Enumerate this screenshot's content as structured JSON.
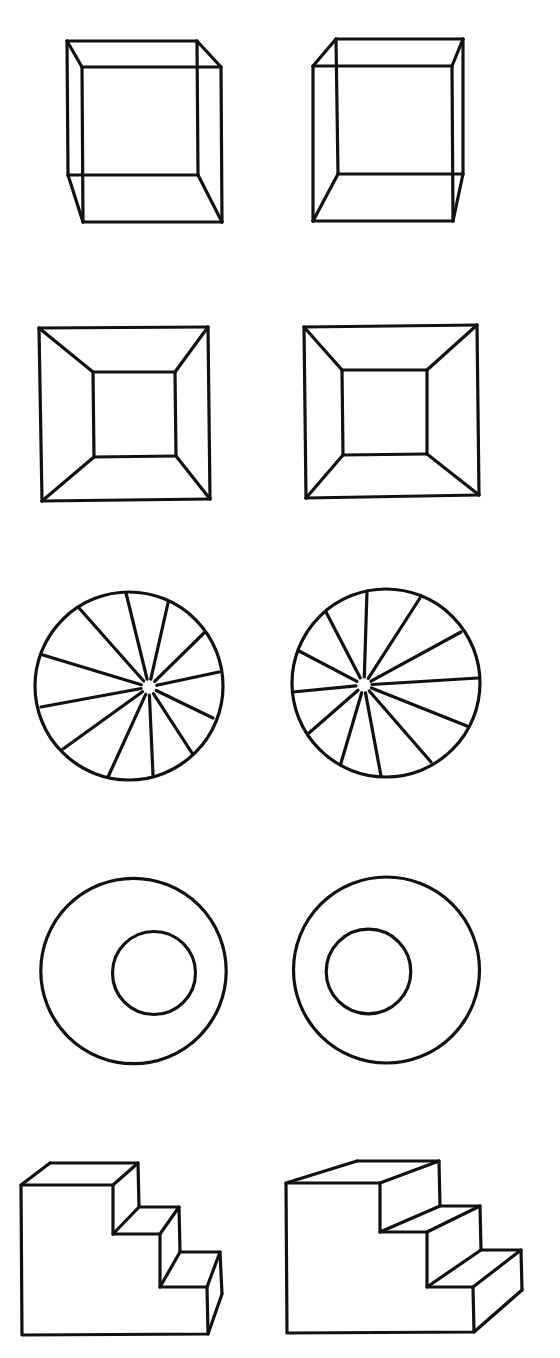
{
  "colors": {
    "background": "#ffffff",
    "stroke": "#111111"
  },
  "stroke_width": 3.2,
  "pairs": [
    {
      "name": "wire-cube-pair",
      "left": {
        "lines": [
          [
            67,
            41,
            197,
            41
          ],
          [
            197,
            41,
            198,
            175
          ],
          [
            198,
            175,
            68,
            175
          ],
          [
            68,
            175,
            67,
            41
          ],
          [
            82,
            67,
            221,
            67
          ],
          [
            221,
            67,
            222,
            222
          ],
          [
            222,
            222,
            83,
            222
          ],
          [
            83,
            222,
            82,
            67
          ],
          [
            67,
            41,
            82,
            67
          ],
          [
            197,
            41,
            221,
            67
          ],
          [
            198,
            175,
            222,
            222
          ],
          [
            68,
            175,
            83,
            222
          ]
        ]
      },
      "right": {
        "lines": [
          [
            336,
            39,
            463,
            39
          ],
          [
            463,
            39,
            463,
            174
          ],
          [
            463,
            174,
            338,
            174
          ],
          [
            338,
            174,
            336,
            39
          ],
          [
            313,
            66,
            452,
            66
          ],
          [
            452,
            66,
            453,
            221
          ],
          [
            453,
            221,
            313,
            221
          ],
          [
            313,
            221,
            313,
            66
          ],
          [
            336,
            39,
            313,
            66
          ],
          [
            463,
            39,
            452,
            66
          ],
          [
            463,
            174,
            453,
            221
          ],
          [
            338,
            174,
            313,
            221
          ]
        ]
      }
    },
    {
      "name": "frustum-pair",
      "left": {
        "lines": [
          [
            39,
            328,
            208,
            327
          ],
          [
            208,
            327,
            210,
            499
          ],
          [
            210,
            499,
            42,
            501
          ],
          [
            42,
            501,
            39,
            328
          ],
          [
            93,
            372,
            175,
            372
          ],
          [
            175,
            372,
            176,
            456
          ],
          [
            176,
            456,
            94,
            457
          ],
          [
            94,
            457,
            93,
            372
          ],
          [
            39,
            328,
            93,
            372
          ],
          [
            208,
            327,
            175,
            372
          ],
          [
            210,
            499,
            176,
            456
          ],
          [
            42,
            501,
            94,
            457
          ]
        ]
      },
      "right": {
        "lines": [
          [
            304,
            327,
            477,
            325
          ],
          [
            477,
            325,
            479,
            495
          ],
          [
            479,
            495,
            306,
            498
          ],
          [
            306,
            498,
            304,
            327
          ],
          [
            342,
            370,
            427,
            370
          ],
          [
            427,
            370,
            427,
            454
          ],
          [
            427,
            454,
            343,
            455
          ],
          [
            343,
            455,
            342,
            370
          ],
          [
            304,
            327,
            342,
            370
          ],
          [
            477,
            325,
            427,
            370
          ],
          [
            479,
            495,
            427,
            454
          ],
          [
            306,
            498,
            343,
            455
          ]
        ]
      }
    },
    {
      "name": "spoked-wheel-pair",
      "left": {
        "circles": [
          [
            129,
            686,
            94
          ]
        ],
        "hub": [
          149,
          687
        ],
        "hub_gap": 8,
        "spoke_ends": [
          [
            126,
            593
          ],
          [
            168,
            603
          ],
          [
            204,
            633
          ],
          [
            219,
            672
          ],
          [
            213,
            718
          ],
          [
            192,
            753
          ],
          [
            153,
            775
          ],
          [
            108,
            777
          ],
          [
            63,
            749
          ],
          [
            41,
            707
          ],
          [
            43,
            655
          ],
          [
            79,
            608
          ]
        ]
      },
      "right": {
        "circles": [
          [
            386,
            683,
            94
          ]
        ],
        "hub": [
          364,
          685
        ],
        "hub_gap": 8,
        "spoke_ends": [
          [
            367,
            591
          ],
          [
            420,
            598
          ],
          [
            461,
            632
          ],
          [
            478,
            678
          ],
          [
            467,
            726
          ],
          [
            431,
            762
          ],
          [
            381,
            776
          ],
          [
            341,
            763
          ],
          [
            309,
            733
          ],
          [
            293,
            692
          ],
          [
            299,
            651
          ],
          [
            326,
            612
          ]
        ]
      }
    },
    {
      "name": "concentric-ring-pair",
      "left": {
        "circles": [
          [
            133.5,
            971,
            92.7
          ],
          [
            154,
            973,
            41.5
          ]
        ]
      },
      "right": {
        "circles": [
          [
            386.5,
            970,
            93
          ],
          [
            368.5,
            971.5,
            42.3
          ]
        ]
      }
    },
    {
      "name": "staircase-pair",
      "left": {
        "polylines": [
          [
            [
              21,
              1185
            ],
            [
              113,
              1185
            ],
            [
              113,
              1234
            ],
            [
              160,
              1234
            ],
            [
              160,
              1287
            ],
            [
              207,
              1287
            ],
            [
              208,
              1334
            ],
            [
              22,
              1335
            ],
            [
              21,
              1185
            ]
          ],
          [
            [
              50,
              1163
            ],
            [
              138,
              1163
            ],
            [
              139,
              1207
            ],
            [
              179,
              1207
            ],
            [
              180,
              1252
            ],
            [
              220,
              1252
            ],
            [
              222,
              1294
            ]
          ]
        ],
        "lines": [
          [
            21,
            1185,
            50,
            1163
          ],
          [
            113,
            1185,
            138,
            1163
          ],
          [
            113,
            1234,
            139,
            1207
          ],
          [
            160,
            1234,
            179,
            1207
          ],
          [
            160,
            1287,
            180,
            1252
          ],
          [
            207,
            1287,
            220,
            1252
          ],
          [
            208,
            1334,
            222,
            1294
          ]
        ]
      },
      "right": {
        "polylines": [
          [
            [
              286,
              1183
            ],
            [
              380,
              1183
            ],
            [
              380,
              1232
            ],
            [
              427,
              1232
            ],
            [
              427,
              1287
            ],
            [
              473,
              1287
            ],
            [
              474,
              1332
            ],
            [
              287,
              1333
            ],
            [
              286,
              1183
            ]
          ],
          [
            [
              357,
              1161
            ],
            [
              439,
              1161
            ],
            [
              440,
              1206
            ],
            [
              480,
              1206
            ],
            [
              481,
              1250
            ],
            [
              521,
              1250
            ],
            [
              522,
              1290
            ]
          ]
        ],
        "lines": [
          [
            286,
            1183,
            357,
            1161
          ],
          [
            380,
            1183,
            439,
            1161
          ],
          [
            380,
            1232,
            440,
            1206
          ],
          [
            427,
            1232,
            480,
            1206
          ],
          [
            427,
            1287,
            481,
            1250
          ],
          [
            473,
            1287,
            521,
            1250
          ],
          [
            474,
            1332,
            522,
            1290
          ]
        ]
      }
    }
  ]
}
